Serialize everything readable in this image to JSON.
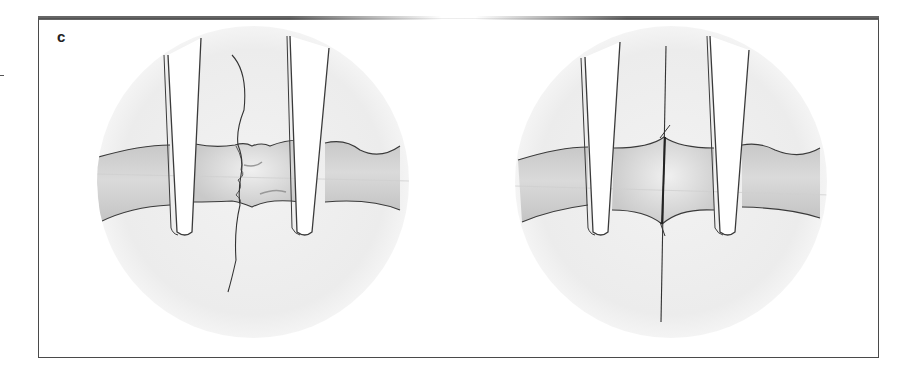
{
  "figure": {
    "panel_label": "c",
    "panels": [
      {
        "id": "left",
        "description": "Vessel ends held by two approximating clamps with irregular, unaligned edges and a loose suture thread"
      },
      {
        "id": "right",
        "description": "Vessel ends approximated with smooth edges and a single suture placed through both ends"
      }
    ],
    "colors": {
      "border": "#4a4a4a",
      "circle_fill": "#eeeeee",
      "vessel_fill": "#cfcfcf",
      "vessel_shadow": "#b5b5b5",
      "line": "#3a3a3a",
      "clamp_fill": "#ffffff"
    }
  }
}
